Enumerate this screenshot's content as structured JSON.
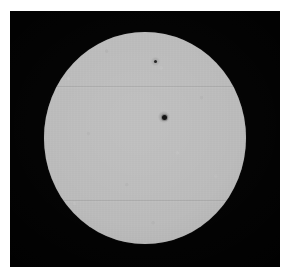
{
  "image": {
    "kind": "astronomical-photograph",
    "subject": "solar-disk",
    "alt_text": "Grayscale photograph of the solar disk showing two dark sunspots",
    "width_px": 291,
    "height_px": 278
  },
  "page": {
    "background_color": "#ffffff",
    "margin_px": 10
  },
  "plate": {
    "name": "photographic-plate",
    "background_color": "#000000",
    "left_px": 10,
    "top_px": 11,
    "width_px": 270,
    "height_px": 256
  },
  "disk": {
    "name": "solar-disk",
    "fill_color": "#bcbcbc",
    "center_x_px": 145,
    "center_y_px": 137,
    "diameter_x_px": 202,
    "diameter_y_px": 212,
    "limb_darkening": "slight",
    "texture": "photographic-grain"
  },
  "sunspots": [
    {
      "id": "sunspot-main",
      "label": "central sunspot",
      "center_x_px": 154,
      "center_y_px": 116,
      "umbra_diameter_px": 5,
      "penumbra_diameter_px": 12,
      "umbra_color": "#161616"
    },
    {
      "id": "sunspot-upper",
      "label": "upper sunspot",
      "center_x_px": 145,
      "center_y_px": 60,
      "umbra_diameter_px": 3,
      "penumbra_diameter_px": 9,
      "umbra_color": "#2a2a2a"
    }
  ],
  "scan_lines": [
    {
      "id": "scan-line-upper",
      "y_px": 75,
      "opacity": 0.085
    },
    {
      "id": "scan-line-lower",
      "y_px": 189,
      "opacity": 0.085
    }
  ]
}
